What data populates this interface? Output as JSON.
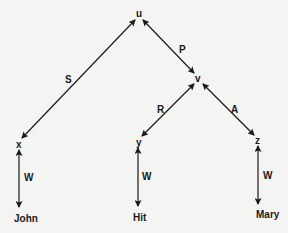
{
  "diagram": {
    "type": "semantic-network",
    "nodes": {
      "u": {
        "label": "u",
        "x": 139,
        "y": 17
      },
      "v": {
        "label": "v",
        "x": 198,
        "y": 80
      },
      "x": {
        "label": "x",
        "x": 19,
        "y": 146
      },
      "y": {
        "label": "y",
        "x": 138,
        "y": 144
      },
      "z": {
        "label": "z",
        "x": 258,
        "y": 142
      }
    },
    "leaves": {
      "john": {
        "label": "John",
        "x": 27,
        "y": 219
      },
      "hit": {
        "label": "Hit",
        "x": 140,
        "y": 218
      },
      "mary": {
        "label": "Mary",
        "x": 268,
        "y": 215
      }
    },
    "edges": [
      {
        "from": "u",
        "to": "x",
        "label": "S",
        "direction": "both"
      },
      {
        "from": "u",
        "to": "v",
        "label": "P",
        "direction": "both"
      },
      {
        "from": "v",
        "to": "y",
        "label": "R",
        "direction": "both"
      },
      {
        "from": "v",
        "to": "z",
        "label": "A",
        "direction": "both"
      },
      {
        "from": "x",
        "to": "John",
        "label": "W",
        "direction": "both"
      },
      {
        "from": "y",
        "to": "Hit",
        "label": "W",
        "direction": "both"
      },
      {
        "from": "z",
        "to": "Mary",
        "label": "W",
        "direction": "both"
      }
    ],
    "edge_labels": {
      "s": "S",
      "p": "P",
      "r": "R",
      "a": "A",
      "w1": "W",
      "w2": "W",
      "w3": "W"
    },
    "colors": {
      "background": "#f4f4f2",
      "ink": "#1a1a1a"
    }
  }
}
